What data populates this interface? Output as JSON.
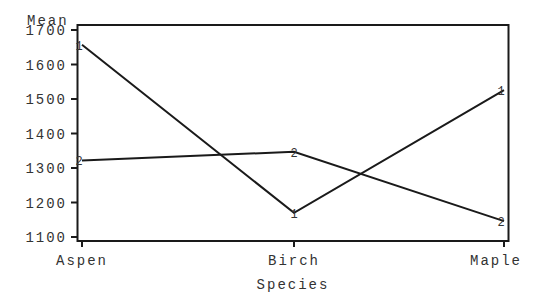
{
  "chart_data": {
    "type": "line",
    "title": "",
    "xlabel": "Species",
    "ylabel": "Mean",
    "categories": [
      "Aspen",
      "Birch",
      "Maple"
    ],
    "series": [
      {
        "name": "1",
        "marker": "1",
        "values": [
          1657,
          1170,
          1526
        ]
      },
      {
        "name": "2",
        "marker": "2",
        "values": [
          1322,
          1347,
          1146
        ]
      }
    ],
    "yticks": [
      1100,
      1200,
      1300,
      1400,
      1500,
      1600,
      1700
    ],
    "ylim": [
      1085,
      1715
    ],
    "grid": false,
    "legend": "none"
  },
  "colors": {
    "line": "#1a1a1a",
    "text": "#333333",
    "background": "#ffffff"
  }
}
